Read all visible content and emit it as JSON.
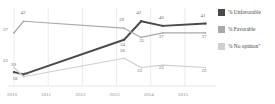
{
  "chart_data": {
    "type": "line",
    "title": "",
    "subtitle": "",
    "xlabel": "",
    "ylabel": "",
    "x": [
      "2010",
      "2011",
      "2012",
      "2013",
      "2014",
      "2015"
    ],
    "tick_labels": [
      "2010",
      "2011",
      "2012",
      "2013",
      "2014",
      "2015"
    ],
    "xlim": [
      2010,
      2015.85
    ],
    "ylim": [
      14,
      46
    ],
    "grid": "vertical-only",
    "legend_position": "right",
    "series": [
      {
        "name": "% Unfavorable",
        "color": "#4a4a4a",
        "points": [
          {
            "x": 2010.0,
            "y": 20,
            "label": "20"
          },
          {
            "x": 2010.28,
            "y": 19,
            "label": "19"
          },
          {
            "x": 2013.22,
            "y": 34,
            "label": "34"
          },
          {
            "x": 2013.72,
            "y": 42,
            "label": "42"
          },
          {
            "x": 2014.35,
            "y": 40,
            "label": "40"
          },
          {
            "x": 2015.6,
            "y": 41,
            "label": "41"
          }
        ]
      },
      {
        "name": "% Favorable",
        "color": "#a9a9a9",
        "points": [
          {
            "x": 2010.0,
            "y": 37,
            "label": "37"
          },
          {
            "x": 2010.28,
            "y": 42,
            "label": "42"
          },
          {
            "x": 2013.22,
            "y": 39,
            "label": "39"
          },
          {
            "x": 2013.72,
            "y": 35,
            "label": "35"
          },
          {
            "x": 2014.35,
            "y": 37,
            "label": "37"
          },
          {
            "x": 2015.6,
            "y": 37,
            "label": "37"
          }
        ]
      },
      {
        "name": "% No opinion\"",
        "color": "#cfcfcf",
        "points": [
          {
            "x": 2010.0,
            "y": 22,
            "label": "22"
          },
          {
            "x": 2010.28,
            "y": 18,
            "label": "18"
          },
          {
            "x": 2013.22,
            "y": 26,
            "label": "26"
          },
          {
            "x": 2013.72,
            "y": 22,
            "label": "22"
          },
          {
            "x": 2014.35,
            "y": 23,
            "label": "23"
          },
          {
            "x": 2015.6,
            "y": 22,
            "label": "22"
          }
        ]
      }
    ]
  },
  "legend": {
    "items": [
      {
        "label": "% Unfavorable",
        "color": "#4a4a4a"
      },
      {
        "label": "% Favorable",
        "color": "#a9a9a9"
      },
      {
        "label": "% No opinion\"",
        "color": "#cfcfcf"
      }
    ]
  },
  "axis": {
    "ticks": [
      {
        "label": "2010"
      },
      {
        "label": "2011"
      },
      {
        "label": "2012"
      },
      {
        "label": "2013"
      },
      {
        "label": "2014"
      },
      {
        "label": "2015"
      }
    ]
  },
  "point_labels": {
    "s0": [
      "20",
      "19",
      "34",
      "42",
      "40",
      "41"
    ],
    "s1": [
      "37",
      "42",
      "39",
      "35",
      "37",
      "37"
    ],
    "s2": [
      "22",
      "18",
      "26",
      "22",
      "23",
      "22"
    ]
  }
}
